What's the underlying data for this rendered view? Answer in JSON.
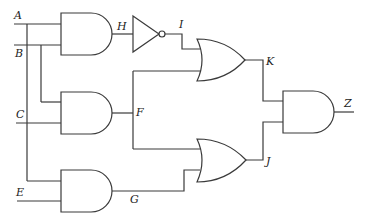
{
  "diagram": {
    "type": "logic-circuit",
    "inputs": [
      {
        "id": "A",
        "label": "A"
      },
      {
        "id": "B",
        "label": "B"
      },
      {
        "id": "C",
        "label": "C"
      },
      {
        "id": "E",
        "label": "E"
      }
    ],
    "gates": [
      {
        "id": "g1",
        "kind": "AND",
        "inputs": [
          "A",
          "B"
        ],
        "output": "H"
      },
      {
        "id": "g2",
        "kind": "NOT",
        "inputs": [
          "H"
        ],
        "output": "I"
      },
      {
        "id": "g3",
        "kind": "AND",
        "inputs": [
          "B",
          "C"
        ],
        "output": "F"
      },
      {
        "id": "g4",
        "kind": "AND",
        "inputs": [
          "A",
          "E"
        ],
        "output": "G"
      },
      {
        "id": "g5",
        "kind": "OR",
        "inputs": [
          "I",
          "F"
        ],
        "output": "K"
      },
      {
        "id": "g6",
        "kind": "OR",
        "inputs": [
          "F",
          "G"
        ],
        "output": "J"
      },
      {
        "id": "g7",
        "kind": "AND",
        "inputs": [
          "K",
          "J"
        ],
        "output": "Z"
      }
    ],
    "labels": {
      "A": "A",
      "B": "B",
      "C": "C",
      "E": "E",
      "H": "H",
      "I": "I",
      "F": "F",
      "G": "G",
      "K": "K",
      "J": "J",
      "Z": "Z"
    },
    "colors": {
      "line": "#3a3a3a",
      "background": "#ffffff",
      "text": "#222222"
    }
  }
}
